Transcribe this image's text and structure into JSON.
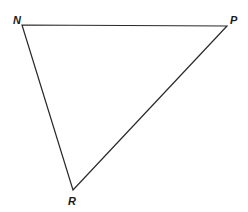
{
  "diagram": {
    "type": "triangle",
    "vertices": [
      {
        "label": "N",
        "x": 22,
        "y": 25
      },
      {
        "label": "P",
        "x": 227,
        "y": 26
      },
      {
        "label": "R",
        "x": 73,
        "y": 190
      }
    ],
    "edges": [
      [
        "N",
        "P"
      ],
      [
        "P",
        "R"
      ],
      [
        "R",
        "N"
      ]
    ],
    "stroke_color": "#2a2a2a"
  }
}
